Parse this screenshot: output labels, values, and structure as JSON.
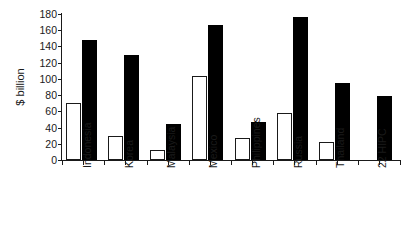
{
  "chart_data": {
    "type": "bar",
    "title": "",
    "xlabel": "",
    "ylabel": "$ billion",
    "ylim": [
      0,
      180
    ],
    "yticks": [
      0,
      20,
      40,
      60,
      80,
      100,
      120,
      140,
      160,
      180
    ],
    "ytick_labels": [
      "0",
      "20",
      "40",
      "60",
      "80",
      "100",
      "120",
      "140",
      "160",
      "180"
    ],
    "grid": false,
    "legend": "none",
    "categories": [
      "Indonesia",
      "Korea",
      "Malaysia",
      "Mexico",
      "Philippines",
      "Russia",
      "Thailand",
      "22 HIPC"
    ],
    "series": [
      {
        "name": "open",
        "style": "white-filled-black-outline",
        "color": "#ffffff",
        "values": [
          70,
          29,
          12,
          103,
          27,
          58,
          22,
          0
        ]
      },
      {
        "name": "filled",
        "style": "black-filled",
        "color": "#000000",
        "values": [
          148,
          130,
          45,
          167,
          47,
          176,
          95,
          79
        ]
      }
    ]
  },
  "axis": {
    "y_title": "$ billion",
    "line_color": "#1a1a1a"
  }
}
